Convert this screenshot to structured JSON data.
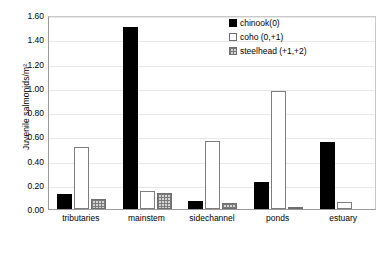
{
  "chart_data": {
    "type": "bar",
    "title": "",
    "xlabel": "",
    "ylabel": "Juvenile salmonids/m²",
    "ylim": [
      0,
      1.6
    ],
    "ytick_labels": [
      "0.00",
      "0.20",
      "0.40",
      "0.60",
      "0.80",
      "1.00",
      "1.20",
      "1.40",
      "1.60"
    ],
    "ytick_values": [
      0,
      0.2,
      0.4,
      0.6,
      0.8,
      1.0,
      1.2,
      1.4,
      1.6
    ],
    "grid": false,
    "legend_position": "top-right",
    "categories": [
      "tributaries",
      "mainstem",
      "sidechannel",
      "ponds",
      "estuary"
    ],
    "series": [
      {
        "name": "chinook(0)",
        "color": "#000000",
        "values": [
          0.12,
          1.5,
          0.07,
          0.22,
          0.55
        ]
      },
      {
        "name": "coho (0,+1)",
        "color": "#ffffff",
        "values": [
          0.51,
          0.15,
          0.56,
          0.97,
          0.06
        ]
      },
      {
        "name": "steelhead (+1,+2)",
        "color": "#d4d4d4",
        "values": [
          0.08,
          0.13,
          0.05,
          0.02,
          0.0
        ]
      }
    ]
  }
}
